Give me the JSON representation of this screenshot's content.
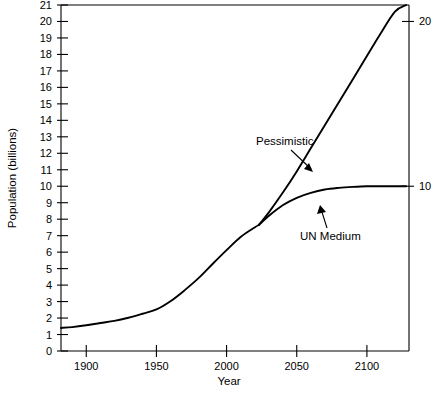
{
  "chart_data": {
    "type": "line",
    "title": "",
    "xlabel": "Year",
    "ylabel": "Population (billions)",
    "xlim": [
      1882,
      2130
    ],
    "ylim": [
      0,
      21
    ],
    "grid": false,
    "legend_position": "inline-annotations",
    "x_ticks": [
      1900,
      1950,
      2000,
      2050,
      2100
    ],
    "x_tick_labels": [
      "1900",
      "1950",
      "2000",
      "2050",
      "2100"
    ],
    "y_ticks": [
      0,
      1,
      2,
      3,
      4,
      5,
      6,
      7,
      8,
      9,
      10,
      11,
      12,
      13,
      14,
      15,
      16,
      17,
      18,
      19,
      20,
      21
    ],
    "y_tick_labels": [
      "0",
      "1",
      "2",
      "3",
      "4",
      "5",
      "6",
      "7",
      "8",
      "9",
      "10",
      "11",
      "12",
      "13",
      "14",
      "15",
      "16",
      "17",
      "18",
      "19",
      "20",
      "21"
    ],
    "y_ticks_right": [
      10,
      20
    ],
    "y_tick_labels_right": [
      "10",
      "20"
    ],
    "series": [
      {
        "name": "Historical",
        "x": [
          1882,
          1890,
          1900,
          1910,
          1920,
          1930,
          1940,
          1950,
          1960,
          1970,
          1980,
          1990,
          2000,
          2010,
          2020,
          2023
        ],
        "values": [
          1.4,
          1.45,
          1.56,
          1.7,
          1.83,
          2.02,
          2.26,
          2.52,
          3.02,
          3.68,
          4.42,
          5.28,
          6.12,
          6.92,
          7.5,
          7.65
        ]
      },
      {
        "name": "Pessimistic",
        "x": [
          2023,
          2030,
          2040,
          2050,
          2060,
          2070,
          2080,
          2090,
          2100,
          2110,
          2120,
          2128
        ],
        "values": [
          7.65,
          8.4,
          9.6,
          10.9,
          12.3,
          13.7,
          15.1,
          16.5,
          17.9,
          19.3,
          20.6,
          21.0
        ]
      },
      {
        "name": "UN Medium",
        "x": [
          2023,
          2030,
          2040,
          2050,
          2060,
          2070,
          2080,
          2090,
          2100,
          2110,
          2120,
          2128
        ],
        "values": [
          7.65,
          8.2,
          8.85,
          9.3,
          9.6,
          9.8,
          9.9,
          9.96,
          10.0,
          10.0,
          10.0,
          10.0
        ]
      }
    ],
    "annotations": [
      {
        "text": "Pessimistic",
        "label_x": 2045,
        "label_y": 13.2
      },
      {
        "text": "UN Medium",
        "label_x": 2063,
        "label_y": 7.0
      }
    ]
  }
}
